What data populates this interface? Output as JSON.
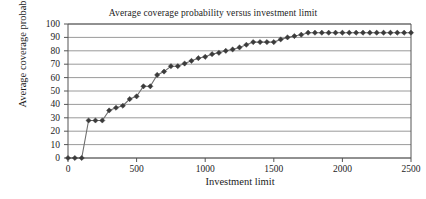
{
  "chart_data": {
    "type": "line",
    "title": "Average coverage probability versus investment limit",
    "xlabel": "Investment limit",
    "ylabel": "Average coverage probability",
    "xlim": [
      0,
      2500
    ],
    "ylim": [
      0,
      100
    ],
    "xticks": [
      0,
      500,
      1000,
      1500,
      2000,
      2500
    ],
    "yticks": [
      0,
      10,
      20,
      30,
      40,
      50,
      60,
      70,
      80,
      90,
      100
    ],
    "grid": "horizontal",
    "legend": "none",
    "marker": "diamond",
    "series_color": "#3b3b3b",
    "line_color": "#6e6e6e",
    "grid_color": "#808080",
    "axis_color": "#555555",
    "background": "#ffffff",
    "x": [
      0,
      50,
      100,
      150,
      200,
      250,
      300,
      350,
      400,
      450,
      500,
      550,
      600,
      650,
      700,
      750,
      800,
      850,
      900,
      950,
      1000,
      1050,
      1100,
      1150,
      1200,
      1250,
      1300,
      1350,
      1400,
      1450,
      1500,
      1550,
      1600,
      1650,
      1700,
      1750,
      1800,
      1850,
      1900,
      1950,
      2000,
      2050,
      2100,
      2150,
      2200,
      2250,
      2300,
      2350,
      2400,
      2450,
      2500
    ],
    "values": [
      0,
      0,
      0,
      28,
      28,
      28,
      35.5,
      37.5,
      39,
      44,
      46,
      53.5,
      53.5,
      62,
      64.5,
      68.5,
      68.5,
      70.5,
      72.5,
      74.5,
      75.5,
      77.5,
      78.5,
      80,
      81,
      82.5,
      84.5,
      86.5,
      86.5,
      86.5,
      86.5,
      88.5,
      90,
      91,
      92,
      93.5,
      93.5,
      93.5,
      93.5,
      93.5,
      93.5,
      93.5,
      93.5,
      93.5,
      93.5,
      93.5,
      93.5,
      93.5,
      93.5,
      93.5,
      93.5
    ],
    "y_tick_labels": [
      "100",
      "90",
      "80",
      "70",
      "60",
      "50",
      "40",
      "30",
      "20",
      "10",
      "0"
    ],
    "x_tick_labels": [
      "0",
      "500",
      "1000",
      "1500",
      "2000",
      "2500"
    ]
  }
}
